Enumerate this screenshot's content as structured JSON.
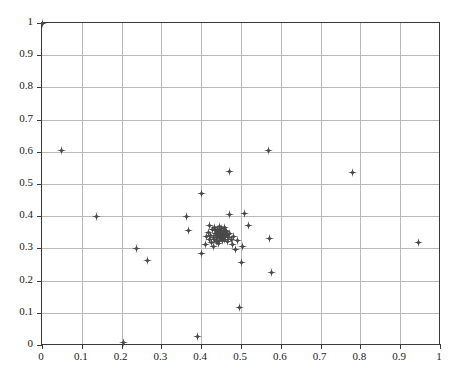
{
  "chart_data": {
    "type": "scatter",
    "title": "",
    "xlabel": "",
    "ylabel": "",
    "xlim": [
      0,
      1
    ],
    "ylim": [
      0,
      1
    ],
    "grid": true,
    "legend": null,
    "marker": "star-marker",
    "marker_color": "#4a4a4a",
    "axis_color": "#3a3a3a",
    "grid_color": "#b9b9b9",
    "background": "#ffffff",
    "xticks": [
      0,
      0.1,
      0.2,
      0.3,
      0.4,
      0.5,
      0.6,
      0.7,
      0.8,
      0.9,
      1
    ],
    "yticks": [
      0,
      0.1,
      0.2,
      0.3,
      0.4,
      0.5,
      0.6,
      0.7,
      0.8,
      0.9,
      1
    ],
    "xtick_labels": [
      "0",
      "0.1",
      "0.2",
      "0.3",
      "0.4",
      "0.5",
      "0.6",
      "0.7",
      "0.8",
      "0.9",
      "1"
    ],
    "ytick_labels": [
      "0",
      "0.1",
      "0.2",
      "0.3",
      "0.4",
      "0.5",
      "0.6",
      "0.7",
      "0.8",
      "0.9",
      "1"
    ],
    "points": [
      [
        0.0,
        1.0
      ],
      [
        0.05,
        0.605
      ],
      [
        0.137,
        0.398
      ],
      [
        0.205,
        0.008
      ],
      [
        0.237,
        0.301
      ],
      [
        0.265,
        0.263
      ],
      [
        0.363,
        0.398
      ],
      [
        0.368,
        0.355
      ],
      [
        0.39,
        0.027
      ],
      [
        0.4,
        0.47
      ],
      [
        0.402,
        0.283
      ],
      [
        0.412,
        0.312
      ],
      [
        0.414,
        0.338
      ],
      [
        0.418,
        0.349
      ],
      [
        0.42,
        0.327
      ],
      [
        0.422,
        0.372
      ],
      [
        0.424,
        0.341
      ],
      [
        0.426,
        0.318
      ],
      [
        0.428,
        0.358
      ],
      [
        0.43,
        0.335
      ],
      [
        0.431,
        0.305
      ],
      [
        0.433,
        0.365
      ],
      [
        0.434,
        0.329
      ],
      [
        0.436,
        0.347
      ],
      [
        0.437,
        0.355
      ],
      [
        0.438,
        0.322
      ],
      [
        0.439,
        0.341
      ],
      [
        0.44,
        0.36
      ],
      [
        0.441,
        0.333
      ],
      [
        0.442,
        0.349
      ],
      [
        0.443,
        0.315
      ],
      [
        0.444,
        0.344
      ],
      [
        0.445,
        0.368
      ],
      [
        0.446,
        0.326
      ],
      [
        0.447,
        0.352
      ],
      [
        0.448,
        0.338
      ],
      [
        0.449,
        0.357
      ],
      [
        0.45,
        0.331
      ],
      [
        0.451,
        0.346
      ],
      [
        0.452,
        0.363
      ],
      [
        0.453,
        0.324
      ],
      [
        0.454,
        0.341
      ],
      [
        0.455,
        0.353
      ],
      [
        0.456,
        0.335
      ],
      [
        0.457,
        0.348
      ],
      [
        0.458,
        0.366
      ],
      [
        0.459,
        0.329
      ],
      [
        0.46,
        0.344
      ],
      [
        0.461,
        0.356
      ],
      [
        0.462,
        0.337
      ],
      [
        0.464,
        0.351
      ],
      [
        0.465,
        0.322
      ],
      [
        0.466,
        0.342
      ],
      [
        0.468,
        0.333
      ],
      [
        0.47,
        0.54
      ],
      [
        0.47,
        0.406
      ],
      [
        0.472,
        0.347
      ],
      [
        0.475,
        0.328
      ],
      [
        0.478,
        0.312
      ],
      [
        0.482,
        0.338
      ],
      [
        0.486,
        0.297
      ],
      [
        0.49,
        0.324
      ],
      [
        0.497,
        0.117
      ],
      [
        0.5,
        0.255
      ],
      [
        0.505,
        0.307
      ],
      [
        0.508,
        0.409
      ],
      [
        0.52,
        0.371
      ],
      [
        0.57,
        0.605
      ],
      [
        0.572,
        0.33
      ],
      [
        0.577,
        0.225
      ],
      [
        0.78,
        0.537
      ],
      [
        0.945,
        0.318
      ]
    ]
  }
}
